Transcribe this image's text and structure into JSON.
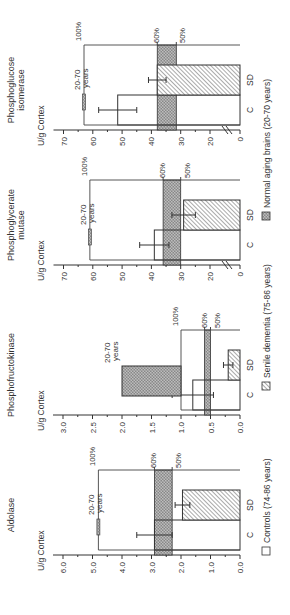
{
  "figure": {
    "legend": [
      {
        "key": "controls",
        "label": "Controls (74-86 years)",
        "pattern": "open"
      },
      {
        "key": "sd",
        "label": "Senile dementia (75-86 years)",
        "pattern": "hatch"
      },
      {
        "key": "normal",
        "label": "Normal aging brains (20-70 years)",
        "pattern": "crosshatch"
      }
    ]
  },
  "chart_data": [
    {
      "type": "bar",
      "title": "Aldolase",
      "ylabel": "U/g Cortex",
      "yticks": [
        "0.0",
        "1.0",
        "2.0",
        "3.0",
        "4.0",
        "5.0",
        "6.0"
      ],
      "ylim": [
        0,
        6.5
      ],
      "categories": [
        "C",
        "SD"
      ],
      "series": [
        {
          "name": "Controls (74-86 years)",
          "values": [
            2.9
          ],
          "error": [
            0.6
          ]
        },
        {
          "name": "Senile dementia (75-86 years)",
          "values": [
            1.95
          ],
          "error": [
            0.25
          ]
        }
      ],
      "normal_20_70_years": {
        "value": 4.8,
        "label": "20-70\nyears"
      },
      "reference_lines": {
        "100%": 4.8,
        "60%": 2.9,
        "50%": 2.3
      }
    },
    {
      "type": "bar",
      "title": "Phosphofructokinase",
      "ylabel": "U/g Cortex",
      "yticks": [
        "0.0",
        "0.5",
        "1.0",
        "1.5",
        "2.0",
        "2.5",
        "3.0"
      ],
      "ylim": [
        0,
        3.2
      ],
      "categories": [
        "C",
        "SD"
      ],
      "series": [
        {
          "name": "Controls (74-86 years)",
          "values": [
            0.8
          ],
          "error": [
            0.35
          ]
        },
        {
          "name": "Senile dementia (75-86 years)",
          "values": [
            0.2
          ],
          "error": [
            0.08
          ]
        }
      ],
      "normal_20_70_years": {
        "range": [
          1.0,
          2.0
        ],
        "label": "20-70\nyears"
      },
      "reference_lines": {
        "100%": 1.0,
        "60%": 0.6,
        "50%": 0.5
      }
    },
    {
      "type": "bar",
      "title": "Phosphoglycerate\nmutase",
      "ylabel": "U/g Cortex",
      "yticks": [
        "0",
        "20",
        "30",
        "40",
        "50",
        "60",
        "70"
      ],
      "axis_break": true,
      "ylim": [
        0,
        75
      ],
      "categories": [
        "C",
        "SD"
      ],
      "series": [
        {
          "name": "Controls (74-86 years)",
          "values": [
            39
          ],
          "error": [
            5
          ]
        },
        {
          "name": "Senile dementia (75-86 years)",
          "values": [
            29
          ],
          "error": [
            4
          ]
        }
      ],
      "normal_20_70_years": {
        "value": 61,
        "label": "20-70\nyears"
      },
      "reference_lines": {
        "100%": 61,
        "60%": 36,
        "50%": 30
      }
    },
    {
      "type": "bar",
      "title": "Phosphoglucose\nisomerase",
      "ylabel": "U/g Cortex",
      "yticks": [
        "0",
        "20",
        "30",
        "40",
        "50",
        "60",
        "70"
      ],
      "axis_break": true,
      "ylim": [
        0,
        75
      ],
      "categories": [
        "C",
        "SD"
      ],
      "series": [
        {
          "name": "Controls (74-86 years)",
          "values": [
            51.5
          ],
          "error": [
            6.5
          ]
        },
        {
          "name": "Senile dementia (75-86 years)",
          "values": [
            38
          ],
          "error": [
            3
          ]
        }
      ],
      "normal_20_70_years": {
        "value": 63,
        "label": "20-70\nyears"
      },
      "reference_lines": {
        "100%": 63,
        "60%": 38,
        "50%": 31.5
      }
    }
  ],
  "labels": {
    "pct100": "100%",
    "pct60": "60%",
    "pct50": "50%",
    "years_line1": "20-70",
    "years_line2": "years",
    "cat_c": "C",
    "cat_sd": "SD"
  }
}
